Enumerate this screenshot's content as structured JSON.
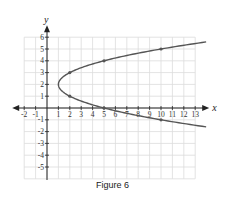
{
  "caption": "Figure 6",
  "chart_data": {
    "type": "line",
    "title": "",
    "xlabel": "x",
    "ylabel": "y",
    "xlim": [
      -2,
      13
    ],
    "ylim": [
      -6,
      6
    ],
    "grid": true,
    "x_ticks": [
      -2,
      -1,
      1,
      2,
      3,
      4,
      5,
      6,
      7,
      8,
      9,
      10,
      11,
      12,
      13
    ],
    "y_ticks": [
      -5,
      -4,
      -3,
      -2,
      -1,
      1,
      2,
      3,
      4,
      5,
      6
    ],
    "series": [
      {
        "name": "x = (y - 2)^2 + 1",
        "equation": "x = (y-2)^2 + 1",
        "vertex": [
          1,
          2
        ],
        "y_range": [
          -1.6,
          5.6
        ],
        "marked_points": [
          [
            2,
            3
          ],
          [
            5,
            4
          ],
          [
            10,
            5
          ],
          [
            2,
            1
          ],
          [
            5,
            0
          ],
          [
            10,
            -1
          ]
        ],
        "color": "#555555"
      }
    ]
  }
}
